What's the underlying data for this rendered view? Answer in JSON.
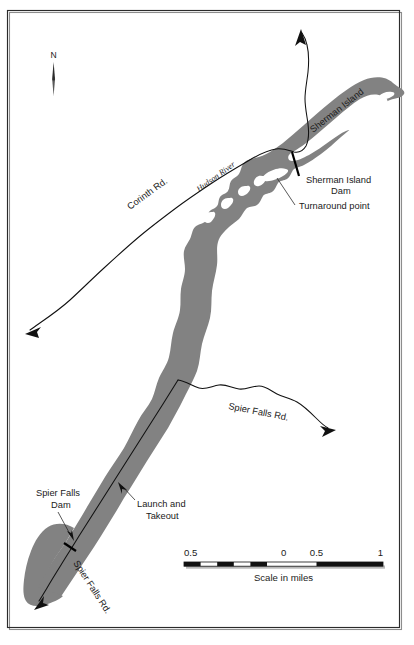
{
  "map": {
    "title": "Hudson River - Sherman Island / Spier Falls section map",
    "colors": {
      "river_fill": "#828282",
      "road_stroke": "#111111",
      "frame": "#2b2b2b",
      "background": "#ffffff",
      "text": "#1a1a1a"
    },
    "compass": {
      "north_label": "N",
      "name": "north-arrow"
    },
    "labels": {
      "corinth_rd": "Corinth Rd.",
      "hudson_river": "Hudson River",
      "sherman_island": "Sherman Island",
      "sherman_island_dam": "Sherman Island\nDam",
      "sherman_island_dam_line1": "Sherman Island",
      "sherman_island_dam_line2": "Dam",
      "turnaround_point": "Turnaround point",
      "spier_falls_rd_mid": "Spier Falls Rd.",
      "spier_falls_rd_low": "Spier Falls Rd.",
      "spier_falls_dam_line1": "Spier Falls",
      "spier_falls_dam_line2": "Dam",
      "launch_line1": "Launch and",
      "launch_line2": "Takeout"
    },
    "scale_bar": {
      "caption": "Scale in miles",
      "ticks": [
        "0.5",
        "0",
        "0.5",
        "1"
      ],
      "tick_0": "0.5",
      "tick_1": "0",
      "tick_2": "0.5",
      "tick_3": "1",
      "units": "miles"
    }
  }
}
